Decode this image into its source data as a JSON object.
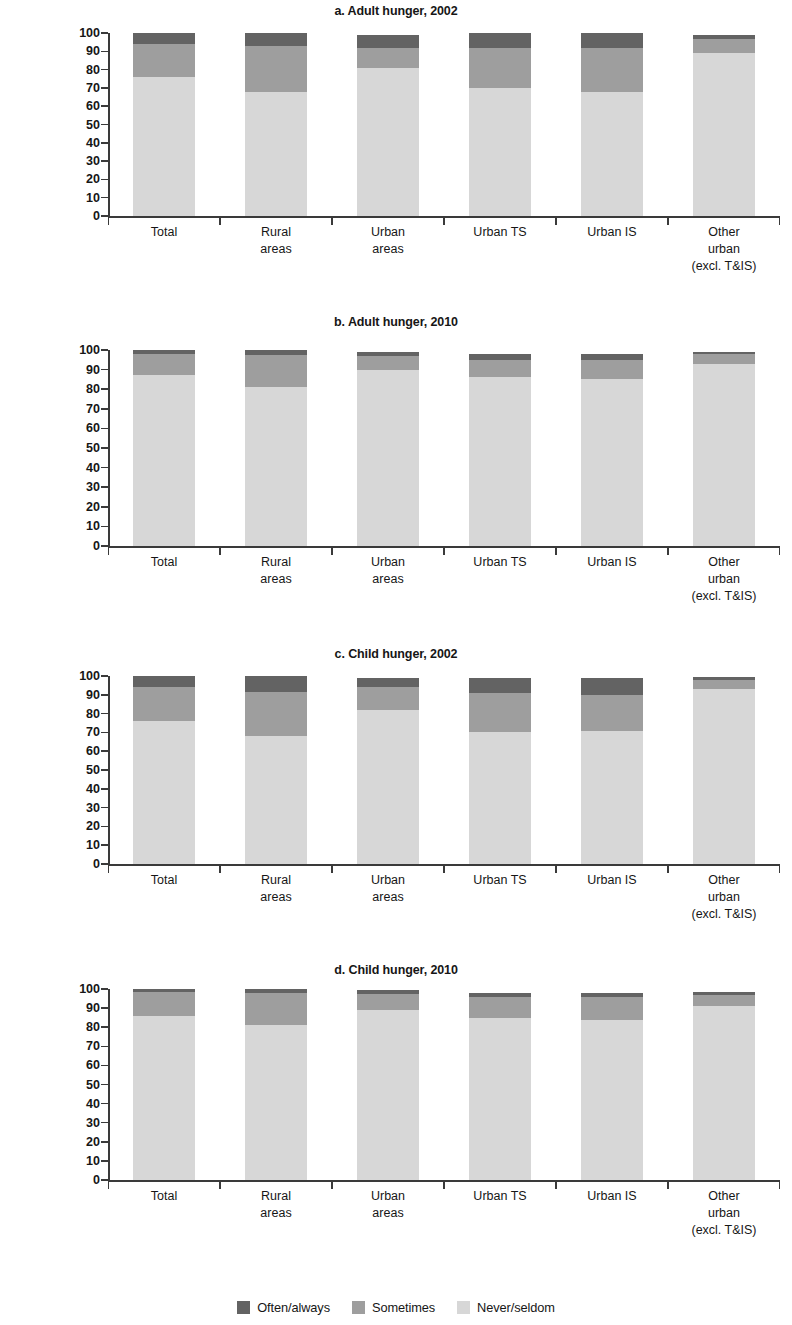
{
  "figure": {
    "categories": [
      "Total",
      "Rural\nareas",
      "Urban\nareas",
      "Urban TS",
      "Urban IS",
      "Other\nurban\n(excl. T&IS)"
    ],
    "series_names": [
      "Often/always",
      "Sometimes",
      "Never/seldom"
    ],
    "colors": {
      "often": "#636363",
      "sometimes": "#9e9e9e",
      "never": "#d7d7d7",
      "axis": "#3a3a3a",
      "text": "#161616"
    },
    "yticks": [
      "0",
      "10",
      "20",
      "30",
      "40",
      "50",
      "60",
      "70",
      "80",
      "90",
      "100"
    ],
    "ylim": [
      0,
      100
    ]
  },
  "legend": {
    "items": [
      {
        "label": "Often/always",
        "color": "#636363"
      },
      {
        "label": "Sometimes",
        "color": "#9e9e9e"
      },
      {
        "label": "Never/seldom",
        "color": "#d7d7d7"
      }
    ]
  },
  "panels": [
    {
      "id": "a",
      "title": "a. Adult hunger, 2002",
      "ylabel": "Population ≥\n18 years old, %"
    },
    {
      "id": "b",
      "title": "b. Adult hunger, 2010",
      "ylabel": "Population ≥18\nyears old, %"
    },
    {
      "id": "c",
      "title": "c. Child hunger, 2002",
      "ylabel": "Population ≤17\nyears old, %"
    },
    {
      "id": "d",
      "title": "d. Child hunger, 2010",
      "ylabel": "Population ≤17\nyears old, %"
    }
  ],
  "chart_data": [
    {
      "type": "bar",
      "stacked": true,
      "panel": "a",
      "title": "a. Adult hunger, 2002",
      "xlabel": "",
      "ylabel": "Population ≥ 18 years old, %",
      "ylim": [
        0,
        100
      ],
      "yticks": [
        0,
        10,
        20,
        30,
        40,
        50,
        60,
        70,
        80,
        90,
        100
      ],
      "grid": false,
      "legend_position": "bottom-figure",
      "categories": [
        "Total",
        "Rural areas",
        "Urban areas",
        "Urban TS",
        "Urban IS",
        "Other urban (excl. T&IS)"
      ],
      "series": [
        {
          "name": "Never/seldom",
          "values": [
            76,
            68,
            81,
            70,
            68,
            89
          ]
        },
        {
          "name": "Sometimes",
          "values": [
            18,
            25,
            11,
            22,
            24,
            8
          ]
        },
        {
          "name": "Often/always",
          "values": [
            6,
            7,
            7,
            8,
            8,
            2
          ]
        }
      ]
    },
    {
      "type": "bar",
      "stacked": true,
      "panel": "b",
      "title": "b. Adult hunger, 2010",
      "xlabel": "",
      "ylabel": "Population ≥18 years old, %",
      "ylim": [
        0,
        100
      ],
      "yticks": [
        0,
        10,
        20,
        30,
        40,
        50,
        60,
        70,
        80,
        90,
        100
      ],
      "grid": false,
      "legend_position": "bottom-figure",
      "categories": [
        "Total",
        "Rural areas",
        "Urban areas",
        "Urban TS",
        "Urban IS",
        "Other urban (excl. T&IS)"
      ],
      "series": [
        {
          "name": "Never/seldom",
          "values": [
            87,
            81,
            90,
            86,
            85,
            93
          ]
        },
        {
          "name": "Sometimes",
          "values": [
            11,
            16.5,
            7,
            9,
            10,
            5
          ]
        },
        {
          "name": "Often/always",
          "values": [
            2,
            2.5,
            2,
            3,
            3,
            1
          ]
        }
      ]
    },
    {
      "type": "bar",
      "stacked": true,
      "panel": "c",
      "title": "c. Child hunger, 2002",
      "xlabel": "",
      "ylabel": "Population ≤17 years old, %",
      "ylim": [
        0,
        100
      ],
      "yticks": [
        0,
        10,
        20,
        30,
        40,
        50,
        60,
        70,
        80,
        90,
        100
      ],
      "grid": false,
      "legend_position": "bottom-figure",
      "categories": [
        "Total",
        "Rural areas",
        "Urban areas",
        "Urban TS",
        "Urban IS",
        "Other urban (excl. T&IS)"
      ],
      "series": [
        {
          "name": "Never/seldom",
          "values": [
            76,
            68,
            82,
            70,
            71,
            93
          ]
        },
        {
          "name": "Sometimes",
          "values": [
            18,
            23.5,
            12,
            21,
            19,
            5
          ]
        },
        {
          "name": "Often/always",
          "values": [
            6,
            8.5,
            5,
            8,
            9,
            1.5
          ]
        }
      ]
    },
    {
      "type": "bar",
      "stacked": true,
      "panel": "d",
      "title": "d. Child hunger, 2010",
      "xlabel": "",
      "ylabel": "Population ≤17 years old, %",
      "ylim": [
        0,
        100
      ],
      "yticks": [
        0,
        10,
        20,
        30,
        40,
        50,
        60,
        70,
        80,
        90,
        100
      ],
      "grid": false,
      "legend_position": "bottom-figure",
      "categories": [
        "Total",
        "Rural areas",
        "Urban areas",
        "Urban TS",
        "Urban IS",
        "Other urban (excl. T&IS)"
      ],
      "series": [
        {
          "name": "Never/seldom",
          "values": [
            86,
            81,
            89,
            85,
            84,
            91
          ]
        },
        {
          "name": "Sometimes",
          "values": [
            12.5,
            17,
            8.5,
            11,
            12,
            6
          ]
        },
        {
          "name": "Often/always",
          "values": [
            1.5,
            2,
            2,
            2,
            2,
            1.5
          ]
        }
      ]
    }
  ]
}
